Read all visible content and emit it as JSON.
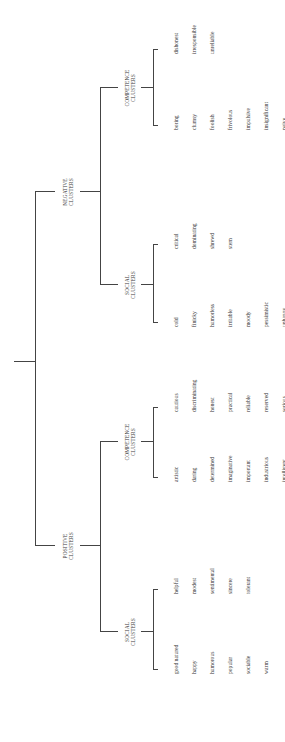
{
  "diagram": {
    "root": "root",
    "negative": {
      "label_line1": "NEGATIVE",
      "label_line2": "CLUSTERS",
      "competence": {
        "label_line1": "COMPETENCE",
        "label_line2": "CLUSTERS",
        "group_a": [
          "dishonest",
          "irresponsible",
          "unreliable"
        ],
        "group_b": [
          "boring",
          "clumsy",
          "foolish",
          "frivolous",
          "impulsive",
          "insignificant",
          "naive",
          "squeamish",
          "submissive",
          "superficial",
          "unimaginative",
          "unintelligent",
          "wasteful",
          "wavering"
        ]
      },
      "social": {
        "label_line1": "SOCIAL",
        "label_line2": "CLUSTERS",
        "group_a": [
          "critical",
          "dominating",
          "shrewd",
          "stern"
        ],
        "group_b": [
          "cold",
          "finicky",
          "humorless",
          "irritable",
          "moody",
          "pessimistic",
          "unhappy",
          "unpopular",
          "unsociable",
          "vain"
        ]
      }
    },
    "positive": {
      "label_line1": "POSITIVE",
      "label_line2": "CLUSTERS",
      "competence": {
        "label_line1": "COMPETENCE",
        "label_line2": "CLUSTERS",
        "group_a": [
          "cautious",
          "discriminating",
          "honest",
          "practical",
          "reliable",
          "reserved",
          "serious"
        ],
        "group_b": [
          "artistic",
          "daring",
          "determined",
          "imaginative",
          "important",
          "industrious",
          "intelligent",
          "meditative",
          "persistent",
          "scientific",
          "skillful"
        ]
      },
      "social": {
        "label_line1": "SOCIAL",
        "label_line2": "CLUSTERS",
        "group_a": [
          "helpful",
          "modest",
          "sentimental",
          "sincere",
          "tolerant"
        ],
        "group_b": [
          "good natured",
          "happy",
          "humorous",
          "popular",
          "sociable",
          "warm"
        ]
      }
    }
  }
}
